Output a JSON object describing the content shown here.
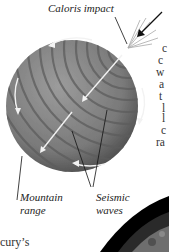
{
  "figure": {
    "labels": {
      "impact": "Caloris impact",
      "mountain": [
        "Mountain",
        "range"
      ],
      "seismic": [
        "Seismic",
        "waves"
      ]
    },
    "clipped_text_right": [
      "c",
      "c",
      "w",
      "a",
      "t",
      "l",
      "l",
      "c",
      "ra"
    ],
    "clipped_text_bottom_left": "cury’s"
  },
  "colors": {
    "sphere": "#8a8a8a",
    "sphere_dark": "#4f4f4f",
    "arrows": "#f2f2f2",
    "leader_lines": "#111111"
  }
}
